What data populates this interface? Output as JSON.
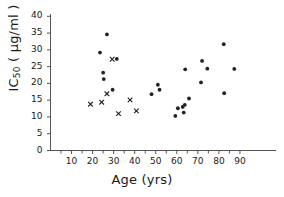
{
  "chart_data": {
    "type": "scatter",
    "title": "",
    "xlabel": "Age (yrs)",
    "ylabel": "IC50 ( µg/ml )",
    "ylabel_main": "IC",
    "ylabel_sub": "50",
    "ylabel_units": " ( µg/ml )",
    "xlim": [
      0,
      95
    ],
    "ylim": [
      0,
      42
    ],
    "xticks": [
      10,
      20,
      30,
      40,
      50,
      60,
      70,
      80,
      90
    ],
    "xtick_labels": [
      "10",
      "20",
      "30",
      "40",
      "50",
      "60",
      "70",
      "80",
      "90"
    ],
    "xminor_step": 5,
    "yticks": [
      0,
      5,
      10,
      15,
      20,
      25,
      30,
      35,
      40
    ],
    "ytick_labels": [
      "0",
      "5",
      "10",
      "15",
      "20",
      "25",
      "30",
      "35",
      "40"
    ],
    "grid": false,
    "legend": false,
    "axis_color": "#555555",
    "marker_color": "#222222",
    "series": [
      {
        "name": "filled-circle",
        "marker": "circle",
        "points": [
          {
            "x": 23.5,
            "y": 29.2
          },
          {
            "x": 25.0,
            "y": 23.2
          },
          {
            "x": 25.3,
            "y": 21.3
          },
          {
            "x": 26.8,
            "y": 34.6
          },
          {
            "x": 29.5,
            "y": 18.1
          },
          {
            "x": 31.5,
            "y": 27.3
          },
          {
            "x": 48.0,
            "y": 16.8
          },
          {
            "x": 51.0,
            "y": 19.6
          },
          {
            "x": 51.8,
            "y": 18.1
          },
          {
            "x": 59.3,
            "y": 10.3
          },
          {
            "x": 60.5,
            "y": 12.6
          },
          {
            "x": 62.8,
            "y": 13.0
          },
          {
            "x": 63.3,
            "y": 11.3
          },
          {
            "x": 63.8,
            "y": 13.6
          },
          {
            "x": 64.0,
            "y": 24.2
          },
          {
            "x": 65.8,
            "y": 15.5
          },
          {
            "x": 71.5,
            "y": 20.3
          },
          {
            "x": 72.0,
            "y": 26.7
          },
          {
            "x": 74.5,
            "y": 24.4
          },
          {
            "x": 82.3,
            "y": 31.7
          },
          {
            "x": 82.5,
            "y": 17.1
          },
          {
            "x": 87.3,
            "y": 24.3
          }
        ]
      },
      {
        "name": "cross",
        "marker": "x",
        "points": [
          {
            "x": 19.0,
            "y": 13.8
          },
          {
            "x": 24.3,
            "y": 14.4
          },
          {
            "x": 26.8,
            "y": 16.9
          },
          {
            "x": 29.3,
            "y": 27.2
          },
          {
            "x": 32.3,
            "y": 11.0
          },
          {
            "x": 37.8,
            "y": 15.1
          },
          {
            "x": 40.8,
            "y": 11.8
          }
        ]
      }
    ]
  }
}
